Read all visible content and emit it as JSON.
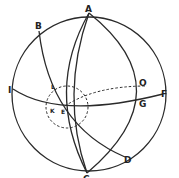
{
  "diagram": {
    "type": "celestial-sphere",
    "stroke_color": "#2a2a2a",
    "background": "#ffffff",
    "labels": {
      "A": "A",
      "B": "B",
      "C": "C",
      "D": "D",
      "E": "E",
      "F": "F",
      "G": "G",
      "I": "I",
      "K": "K",
      "L": "L",
      "O": "O"
    }
  }
}
